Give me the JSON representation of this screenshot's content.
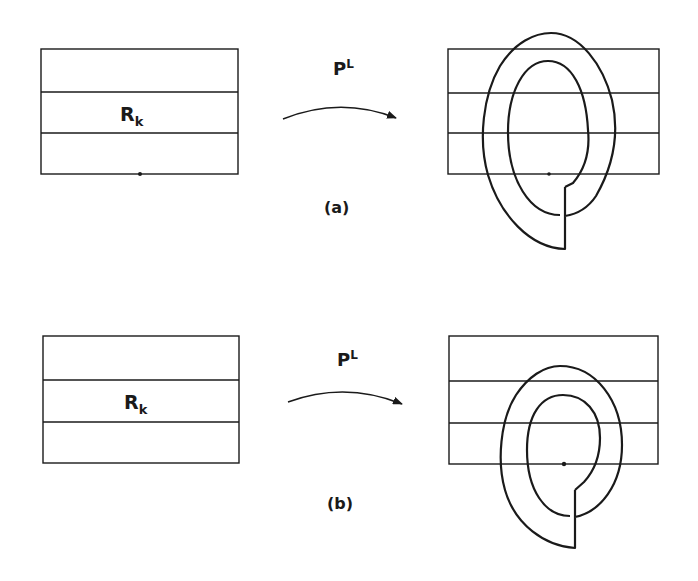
{
  "figure": {
    "panels": [
      {
        "id": "a",
        "caption": "(a)",
        "source_label": "R",
        "source_label_sub": "k",
        "map_label": "P",
        "map_label_sup": "L"
      },
      {
        "id": "b",
        "caption": "(b)",
        "source_label": "R",
        "source_label_sub": "k",
        "map_label": "P",
        "map_label_sup": "L"
      }
    ]
  },
  "colors": {
    "ink": "#1a1a1a",
    "background": "#ffffff"
  }
}
